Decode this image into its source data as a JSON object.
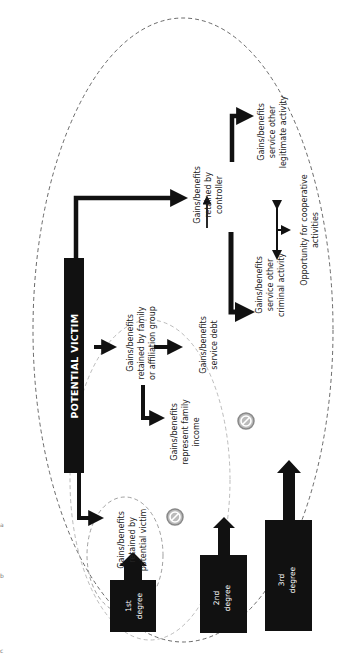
{
  "diagram": {
    "orientation": "rotated-90-ccw",
    "central_node": {
      "label": "POTENTIAL VICTIM"
    },
    "degrees": [
      {
        "id": "first",
        "label_line1": "1st",
        "label_line2": "degree"
      },
      {
        "id": "second",
        "label_line1": "2nd",
        "label_line2": "degree"
      },
      {
        "id": "third",
        "label_line1": "3rd",
        "label_line2": "degree"
      }
    ],
    "nodes": {
      "retained_by_victim": {
        "lines": [
          "Gains/benefits",
          "retained by",
          "potential victim"
        ]
      },
      "retained_by_family": {
        "lines": [
          "Gains/benefits",
          "retained by family",
          "or affiliation group"
        ]
      },
      "family_income": {
        "lines": [
          "Gains/benefits",
          "represent family",
          "income"
        ]
      },
      "service_debt": {
        "lines": [
          "Gains/benefits",
          "service debt"
        ]
      },
      "retained_by_controller": {
        "lines": [
          "Gains/benefits",
          "retained by",
          "controller"
        ]
      },
      "criminal_activity": {
        "lines": [
          "Gains/benefits",
          "service other",
          "criminal activity"
        ]
      },
      "legitimate_activity": {
        "lines": [
          "Gains/benefits",
          "service other",
          "legitimate activity"
        ]
      },
      "cooperative": {
        "lines": [
          "Opportunity for cooperative",
          "activities"
        ]
      }
    },
    "margin_marks": [
      "a",
      "b",
      "c"
    ],
    "colors": {
      "box_fill": "#111111",
      "arrow": "#111111",
      "outer_ellipse": "#444444",
      "inner_ellipse": "#aaaaaa",
      "prohibit_icon": "#999999"
    }
  }
}
